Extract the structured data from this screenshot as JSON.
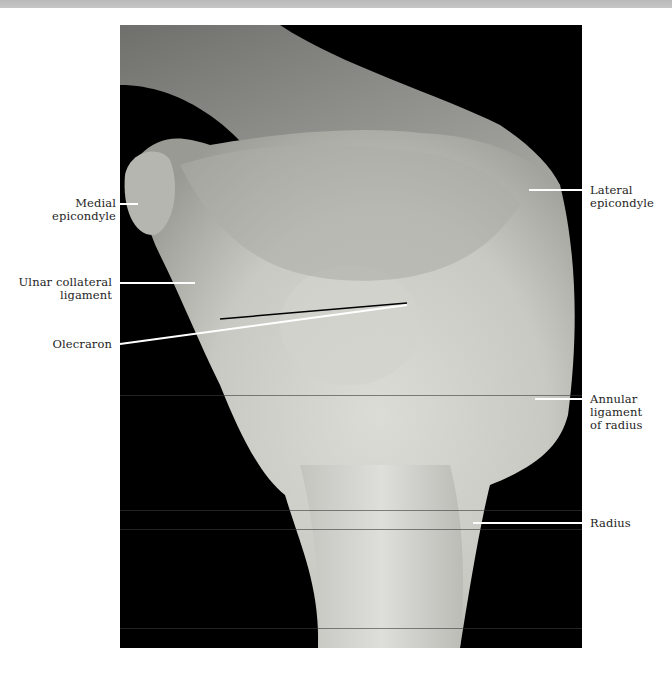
{
  "figure": {
    "background_color": "#000000",
    "label_color": "#1e1e1e"
  },
  "labels": {
    "medial_epicondyle": "Medial epicondyle",
    "ulnar_collateral_ligament_line1": "Ulnar collateral",
    "ulnar_collateral_ligament_line2": "ligament",
    "olecranon": "Olecraron",
    "lateral_epicondyle_line1": "Lateral",
    "lateral_epicondyle_line2": "epicondyle",
    "annular_ligament_line1": "Annular",
    "annular_ligament_line2": "ligament",
    "annular_ligament_line3": "of radius",
    "radius": "Radius"
  }
}
